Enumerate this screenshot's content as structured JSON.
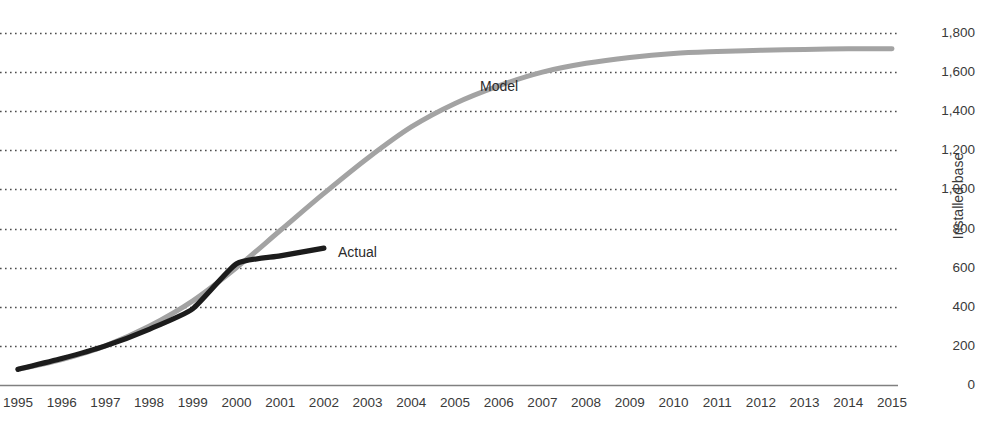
{
  "chart_data": {
    "type": "line",
    "title": "",
    "xlabel": "",
    "ylabel": "Installed base",
    "xlim": [
      1995,
      2015
    ],
    "ylim": [
      0,
      1800
    ],
    "ytick_values": [
      0,
      200,
      400,
      600,
      800,
      1000,
      1200,
      1400,
      1600,
      1800
    ],
    "ytick_labels": [
      "0",
      "200",
      "400",
      "600",
      "800",
      "1,000",
      "1,200",
      "1,400",
      "1,600",
      "1,800"
    ],
    "xtick_labels": [
      "1995",
      "1996",
      "1997",
      "1998",
      "1999",
      "2000",
      "2001",
      "2002",
      "2003",
      "2004",
      "2005",
      "2006",
      "2007",
      "2008",
      "2009",
      "2010",
      "2011",
      "2012",
      "2013",
      "2014",
      "2015"
    ],
    "grid": true,
    "grid_style": "dotted-horizontal",
    "legend_position": "inline-annotation",
    "series": [
      {
        "name": "Model",
        "color": "#a3a3a3",
        "x": [
          1995,
          1996,
          1997,
          1998,
          1999,
          2000,
          2001,
          2002,
          2003,
          2004,
          2005,
          2006,
          2007,
          2008,
          2009,
          2010,
          2011,
          2012,
          2013,
          2014,
          2015
        ],
        "values": [
          80,
          130,
          200,
          300,
          430,
          600,
          790,
          980,
          1160,
          1320,
          1440,
          1530,
          1600,
          1645,
          1675,
          1695,
          1705,
          1712,
          1716,
          1719,
          1720
        ]
      },
      {
        "name": "Actual",
        "color": "#1c1c1c",
        "x": [
          1995,
          1996,
          1997,
          1998,
          1999,
          2000,
          2001,
          2002
        ],
        "values": [
          80,
          135,
          200,
          285,
          390,
          620,
          660,
          700
        ]
      }
    ],
    "annotations": [
      {
        "text": "Model",
        "series": "Model"
      },
      {
        "text": "Actual",
        "series": "Actual"
      }
    ]
  },
  "axis": {
    "y_axis_title": "Installed base"
  }
}
